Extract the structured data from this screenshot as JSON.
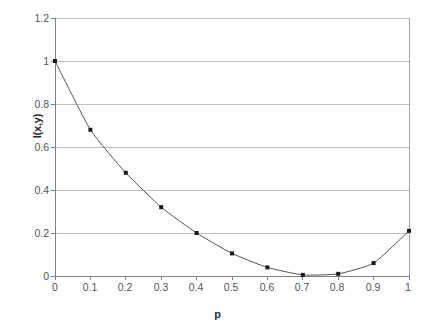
{
  "chart_data": {
    "type": "line",
    "title": "",
    "subtitle": "",
    "xlabel": "p",
    "ylabel": "I(x,y)",
    "x": [
      0,
      0.1,
      0.2,
      0.3,
      0.4,
      0.5,
      0.6,
      0.7,
      0.8,
      0.9,
      1
    ],
    "values": [
      1,
      0.68,
      0.48,
      0.32,
      0.2,
      0.105,
      0.04,
      0.005,
      0.01,
      0.06,
      0.21
    ],
    "series": [
      {
        "name": "I(x,y)",
        "values": [
          1,
          0.68,
          0.48,
          0.32,
          0.2,
          0.105,
          0.04,
          0.005,
          0.01,
          0.06,
          0.21
        ]
      }
    ],
    "xlim": [
      0,
      1
    ],
    "ylim": [
      0,
      1.2
    ],
    "x_ticks": [
      "0",
      "0.1",
      "0.2",
      "0.3",
      "0.4",
      "0.5",
      "0.6",
      "0.7",
      "0.8",
      "0.9",
      "1"
    ],
    "y_ticks": [
      "0",
      "0.2",
      "0.4",
      "0.6",
      "0.8",
      "1",
      "1.2"
    ],
    "y_tick_values": [
      0,
      0.2,
      0.4,
      0.6,
      0.8,
      1,
      1.2
    ],
    "x_tick_values": [
      0,
      0.1,
      0.2,
      0.3,
      0.4,
      0.5,
      0.6,
      0.7,
      0.8,
      0.9,
      1
    ],
    "grid": {
      "horizontal": true,
      "vertical": false,
      "color": "#bfbfbf"
    },
    "legend": {
      "visible": false,
      "position": "none",
      "entries": []
    },
    "marker": {
      "shape": "square",
      "color": "#1a1a1a",
      "size": 4
    },
    "line": {
      "color": "#555555",
      "width": 1
    },
    "plot_border_color": "#a6a6a6",
    "background_color": "#ffffff"
  },
  "axes": {
    "y_title": "I(x,y)",
    "x_title": "p"
  }
}
